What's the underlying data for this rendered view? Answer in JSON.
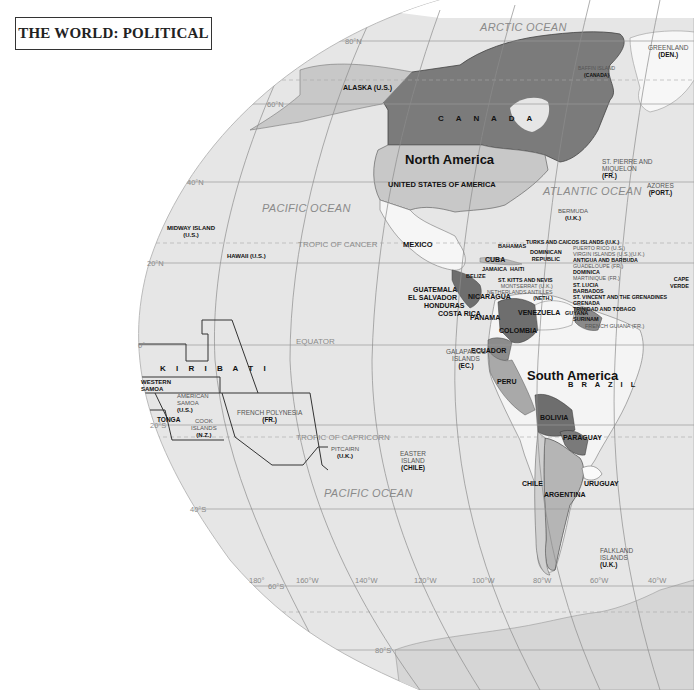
{
  "title": "THE WORLD: POLITICAL",
  "colors": {
    "ocean": "#e6e6e6",
    "canada": "#7b7b7b",
    "usa": "#c8c8c8",
    "mexico": "#f6f6f6",
    "brazil": "#f4f4f4",
    "dark_countries": "#6e6e6e",
    "mid_countries": "#a9a9a9",
    "graticule": "#9a9a9a"
  },
  "oceans": {
    "arctic": "ARCTIC OCEAN",
    "north_pacific": "PACIFIC OCEAN",
    "south_pacific": "PACIFIC OCEAN",
    "atlantic": "ATLANTIC OCEAN"
  },
  "continents": {
    "north_america": "North America",
    "south_america": "South America"
  },
  "lines": {
    "tropic_cancer": "TROPIC OF CANCER",
    "equator": "EQUATOR",
    "tropic_capricorn": "TROPIC OF CAPRICORN"
  },
  "latitudes": {
    "n80": "80°N",
    "n60": "60°N",
    "n40": "40°N",
    "n20": "20°N",
    "zero": "0°",
    "s20": "20°S",
    "s40": "40°S",
    "s60": "60°S",
    "s80": "80°S"
  },
  "longitudes": [
    "180°",
    "160°W",
    "140°W",
    "120°W",
    "100°W",
    "80°W",
    "60°W",
    "40°W"
  ],
  "countries": {
    "canada": "C A N A D A",
    "usa": "UNITED STATES OF AMERICA",
    "mexico": "MEXICO",
    "cuba": "CUBA",
    "bahamas": "BAHAMAS",
    "jamaica": "JAMAICA",
    "haiti": "HAITI",
    "dominican_republic": [
      "DOMINICAN",
      "REPUBLIC"
    ],
    "belize": "BELIZE",
    "guatemala": "GUATEMALA",
    "el_salvador": "EL SALVADOR",
    "honduras": "HONDURAS",
    "nicaragua": "NICARAGUA",
    "costa_rica": "COSTA RICA",
    "panama": "PANAMA",
    "colombia": "COLOMBIA",
    "venezuela": "VENEZUELA",
    "guyana": "GUYANA",
    "surinam": "SURINAM",
    "ecuador": "ECUADOR",
    "peru": "PERU",
    "brazil": "B R A Z I L",
    "bolivia": "BOLIVIA",
    "paraguay": "PARAGUAY",
    "chile": "CHILE",
    "argentina": "ARGENTINA",
    "uruguay": "URUGUAY",
    "kiribati": "K I R I B A T I",
    "western_samoa": [
      "WESTERN",
      "SAMOA"
    ],
    "tonga": "TONGA"
  },
  "territories": {
    "alaska": "ALASKA (U.S.)",
    "greenland": [
      "GREENLAND",
      "(DEN.)"
    ],
    "baffin": [
      "BAFFIN ISLAND",
      "(CANADA)"
    ],
    "st_pierre": [
      "ST. PIERRE AND",
      "MIQUELON",
      "(FR.)"
    ],
    "azores": [
      "AZORES",
      "(PORT.)"
    ],
    "bermuda": [
      "BERMUDA",
      "(U.K.)"
    ],
    "midway": [
      "MIDWAY ISLAND",
      "(U.S.)"
    ],
    "hawaii": "HAWAII (U.S.)",
    "cape_verde": [
      "CAPE",
      "VERDE"
    ],
    "galapagos": [
      "GALAPAGOS",
      "ISLANDS",
      "(EC.)"
    ],
    "french_guiana": "FRENCH GUIANA (FR.)",
    "american_samoa": [
      "AMERICAN",
      "SAMOA",
      "(U.S.)"
    ],
    "cook_islands": [
      "COOK",
      "ISLANDS",
      "(N.Z.)"
    ],
    "french_polynesia": [
      "FRENCH POLYNESIA",
      "(FR.)"
    ],
    "pitcairn": [
      "PITCAIRN",
      "(U.K.)"
    ],
    "easter_island": [
      "EASTER",
      "ISLAND",
      "(CHILE)"
    ],
    "falkland": [
      "FALKLAND",
      "ISLANDS",
      "(U.K.)"
    ]
  },
  "caribbean_list": [
    "TURKS AND CAICOS ISLANDS (U.K.)",
    "PUERTO RICO (U.S.)",
    "VIRGIN ISLANDS (U.S.)(U.K.)",
    "ANTIGUA AND BARBUDA",
    "GUADELOUPE (FR.)",
    "DOMINICA",
    "MARTINIQUE (FR.)",
    "ST. LUCIA",
    "BARBADOS",
    "ST. VINCENT AND THE GRENADINES",
    "GRENADA",
    "TRINIDAD AND TOBAGO"
  ],
  "caribbean_left": {
    "st_kitts": "ST. KITTS AND NEVIS",
    "montserrat": "MONTSERRAT (U.K.)",
    "netherlands_antilles": [
      "NETHERLANDS ANTILLES",
      "(NETH.)"
    ]
  }
}
